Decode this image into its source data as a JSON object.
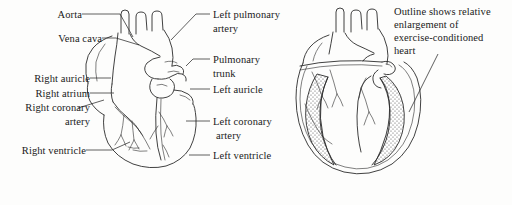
{
  "figure": {
    "background_color": "#fdfdfc",
    "ink_color": "#2b2b2b"
  },
  "labels": {
    "aorta": "Aorta",
    "vena_cava": "Vena cava",
    "right_auricle": "Right auricle",
    "right_atrium": "Right atrium",
    "right_coronary_artery_line1": "Right coronary",
    "right_coronary_artery_line2": "artery",
    "right_ventricle": "Right ventricle",
    "left_pulmonary_artery_line1": "Left pulmonary",
    "left_pulmonary_artery_line2": "artery",
    "pulmonary_trunk_line1": "Pulmonary",
    "pulmonary_trunk_line2": "trunk",
    "left_auricle": "Left auricle",
    "left_coronary_artery_line1": "Left coronary",
    "left_coronary_artery_line2": "artery",
    "left_ventricle": "Left ventricle"
  },
  "annotation": {
    "line1": "Outline shows relative",
    "line2": "enlargement of",
    "line3": "exercise-conditioned",
    "line4": "heart"
  },
  "caption": {
    "clipped_text": " "
  },
  "diagrams": [
    {
      "name": "external-heart",
      "description": "Anterior external view of heart with great vessels and coronary arteries"
    },
    {
      "name": "cutaway-heart",
      "description": "Sectioned heart with stippled myocardial wall and second outline showing enlarged exercise-conditioned heart"
    }
  ]
}
